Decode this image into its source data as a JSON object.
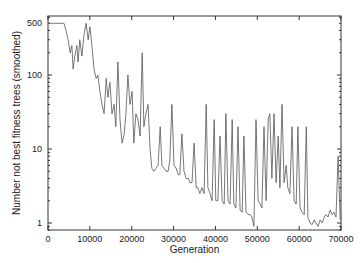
{
  "chart_data": {
    "type": "line",
    "title": "",
    "xlabel": "Generation",
    "ylabel": "Number not best fitness trees (smoothed)",
    "xlim": [
      0,
      70000
    ],
    "ylim": [
      0.8,
      600
    ],
    "yscale": "log",
    "grid": false,
    "legend": "none",
    "xticks": [
      0,
      10000,
      20000,
      30000,
      40000,
      50000,
      60000,
      70000
    ],
    "xtick_labels": [
      "0",
      "10000",
      "20000",
      "30000",
      "40000",
      "50000",
      "60000",
      "70000"
    ],
    "yticks": [
      1,
      10,
      100,
      500
    ],
    "ytick_labels": [
      "1",
      "10",
      "100",
      "500"
    ],
    "line_color": "#555555",
    "series": [
      {
        "name": "not-best-fitness",
        "x": [
          0,
          3800,
          4300,
          4800,
          5300,
          5700,
          6000,
          6400,
          6900,
          7200,
          7600,
          8100,
          8600,
          9100,
          9600,
          10000,
          10500,
          11000,
          11500,
          11900,
          12400,
          12900,
          13400,
          13900,
          14300,
          14800,
          15300,
          15800,
          16200,
          16700,
          17200,
          17700,
          18200,
          18600,
          19100,
          19600,
          20100,
          20500,
          21000,
          21500,
          22000,
          22500,
          22900,
          23400,
          23900,
          24400,
          24800,
          25300,
          25800,
          26300,
          26800,
          27200,
          27700,
          28200,
          28700,
          29100,
          29600,
          30100,
          30600,
          31100,
          31500,
          32000,
          32500,
          33000,
          33500,
          33900,
          34400,
          34900,
          35400,
          35800,
          36300,
          36800,
          37300,
          37800,
          38200,
          38700,
          39200,
          39700,
          40100,
          40600,
          41100,
          41600,
          42100,
          42500,
          43000,
          43500,
          44000,
          44400,
          44900,
          45400,
          45900,
          46400,
          46800,
          47300,
          47800,
          48300,
          48700,
          49200,
          49700,
          50200,
          50700,
          51100,
          51600,
          52100,
          52600,
          53000,
          53500,
          54000,
          54500,
          55000,
          55400,
          55900,
          56400,
          56900,
          57300,
          57800,
          58300,
          58800,
          59300,
          59700,
          60200,
          60700,
          61200,
          61700,
          62100,
          62600,
          63100,
          63600,
          64000,
          64500,
          65000,
          65500,
          66000,
          66400,
          66900,
          67400,
          67900,
          68300,
          68800,
          69300,
          69800
        ],
        "y": [
          500,
          500,
          400,
          300,
          200,
          250,
          120,
          180,
          250,
          150,
          300,
          180,
          350,
          500,
          300,
          450,
          250,
          120,
          90,
          100,
          60,
          40,
          30,
          90,
          50,
          80,
          30,
          40,
          20,
          150,
          25,
          12,
          16,
          30,
          100,
          40,
          60,
          12,
          30,
          25,
          15,
          200,
          20,
          30,
          40,
          10,
          5.5,
          5,
          5.5,
          6,
          20,
          6,
          5.5,
          5,
          5,
          7,
          40,
          6,
          5.5,
          4.5,
          4.5,
          16,
          5,
          4,
          4,
          3.5,
          3.5,
          12,
          3,
          3,
          2.5,
          3,
          2.5,
          40,
          3,
          2.5,
          2,
          25,
          2,
          2,
          15,
          2,
          1.8,
          30,
          2,
          1.8,
          25,
          1.8,
          1.6,
          20,
          1.5,
          1.4,
          15,
          1.4,
          1.3,
          1.3,
          1.2,
          0.9,
          25,
          2,
          1.8,
          1.6,
          20,
          2,
          25,
          30,
          4,
          30,
          3.5,
          15,
          3,
          40,
          3.5,
          6,
          3,
          2.5,
          20,
          2,
          1.8,
          20,
          1.6,
          1.4,
          1.3,
          20,
          1.2,
          1,
          0.95,
          1.1,
          1,
          0.9,
          1.1,
          1,
          1.2,
          1.3,
          1.2,
          1.5,
          1.3,
          1.4,
          1.2,
          8,
          1.1
        ]
      }
    ]
  }
}
